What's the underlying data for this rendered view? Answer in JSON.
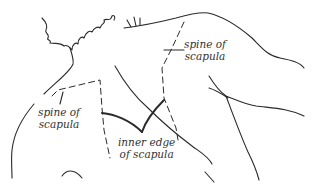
{
  "diagram": {
    "labels": [
      {
        "id": "spine-of-scapula-right",
        "line1": "spine of",
        "line2": "scapula"
      },
      {
        "id": "spine-of-scapula-left",
        "line1": "spine of",
        "line2": "scapula"
      },
      {
        "id": "inner-edge-of-scapula",
        "line1": "inner edge",
        "line2": "of scapula"
      }
    ],
    "colors": {
      "background": "#ffffff",
      "ink": "#2a2a2a"
    }
  }
}
